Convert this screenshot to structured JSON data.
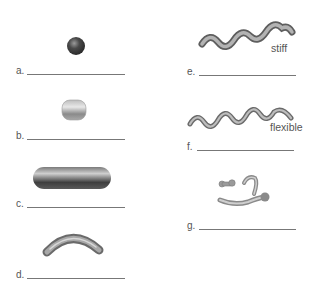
{
  "items": [
    {
      "label": "a.",
      "shape": "sphere"
    },
    {
      "label": "b.",
      "shape": "rounded-cube"
    },
    {
      "label": "c.",
      "shape": "rod"
    },
    {
      "label": "d.",
      "shape": "curved-rod"
    },
    {
      "label": "e.",
      "shape": "stiff-spiral",
      "annotation": "stiff"
    },
    {
      "label": "f.",
      "shape": "flexible-spiral",
      "annotation": "flexible"
    },
    {
      "label": "g.",
      "shape": "pleomorphic"
    }
  ],
  "colors": {
    "line": "#777777",
    "text": "#555555",
    "shape_dark": "#3a3a3a",
    "shape_mid": "#8a8a8a",
    "shape_light": "#d0d0d0"
  }
}
